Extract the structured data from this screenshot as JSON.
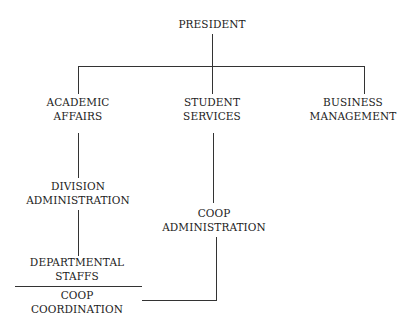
{
  "chart_title": "",
  "nodes": {
    "president": {
      "lines": [
        "PRESIDENT"
      ]
    },
    "academic_affairs": {
      "lines": [
        "ACADEMIC",
        "AFFAIRS"
      ]
    },
    "student_services": {
      "lines": [
        "STUDENT",
        "SERVICES"
      ]
    },
    "business_management": {
      "lines": [
        "BUSINESS",
        "MANAGEMENT"
      ]
    },
    "division_administration": {
      "lines": [
        "DIVISION",
        "ADMINISTRATION"
      ]
    },
    "coop_administration": {
      "lines": [
        "COOP",
        "ADMINISTRATION"
      ]
    },
    "departmental_staffs": {
      "lines": [
        "DEPARTMENTAL",
        "STAFFS"
      ]
    },
    "coop_coordination": {
      "lines": [
        "COOP",
        "COORDINATION"
      ]
    }
  },
  "edges": [
    [
      "president",
      "academic_affairs"
    ],
    [
      "president",
      "student_services"
    ],
    [
      "president",
      "business_management"
    ],
    [
      "academic_affairs",
      "division_administration"
    ],
    [
      "division_administration",
      "departmental_staffs"
    ],
    [
      "student_services",
      "coop_administration"
    ],
    [
      "coop_administration",
      "coop_coordination"
    ]
  ],
  "colors": {
    "line": "#333333",
    "text": "#222222",
    "background": "#ffffff"
  }
}
